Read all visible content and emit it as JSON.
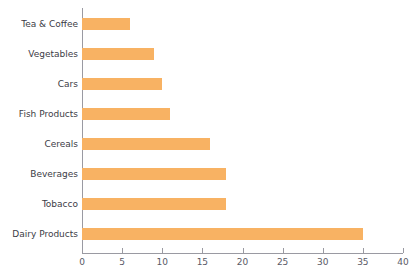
{
  "chart_data": {
    "type": "bar",
    "orientation": "horizontal",
    "title": "",
    "subtitle": "",
    "xlabel": "",
    "ylabel": "",
    "categories": [
      "Tea & Coffee",
      "Vegetables",
      "Cars",
      "Fish Products",
      "Cereals",
      "Beverages",
      "Tobacco",
      "Dairy Products"
    ],
    "values": [
      6,
      9,
      10,
      11,
      16,
      18,
      18,
      35
    ],
    "xlim": [
      0,
      40
    ],
    "xticks": [
      0,
      5,
      10,
      15,
      20,
      25,
      30,
      35,
      40
    ],
    "xtick_labels": [
      "0",
      "5",
      "10",
      "15",
      "20",
      "25",
      "30",
      "35",
      "40"
    ],
    "grid": false,
    "legend": null,
    "bar_color": "#f8b263",
    "axis_color": "#9a9aa2",
    "label_color": "#3c3c46",
    "tick_label_color": "#5a5a66",
    "background": "#ffffff"
  }
}
